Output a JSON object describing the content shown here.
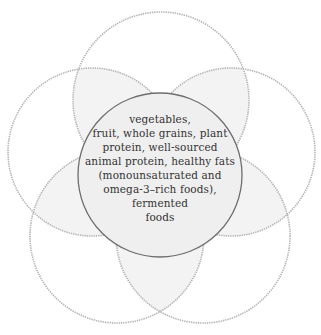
{
  "diagram": {
    "type": "flower-venn",
    "center": {
      "label_lines": [
        "vegetables,",
        "fruit, whole grains, plant",
        "protein, well-sourced",
        "animal protein, healthy fats",
        "(monounsaturated and",
        "omega-3–rich foods),",
        "fermented",
        "foods"
      ]
    },
    "petals": [
      {
        "position": "top",
        "label": ""
      },
      {
        "position": "upper-right",
        "label": ""
      },
      {
        "position": "lower-right",
        "label": ""
      },
      {
        "position": "lower-left",
        "label": ""
      },
      {
        "position": "upper-left",
        "label": ""
      }
    ],
    "colors": {
      "background": "#ffffff",
      "petal_stroke": "#b5b5b5",
      "overlap_fill": "#f3f3f3",
      "center_fill": "#efefef",
      "center_stroke": "#6e6e6e",
      "text": "#333333"
    }
  }
}
